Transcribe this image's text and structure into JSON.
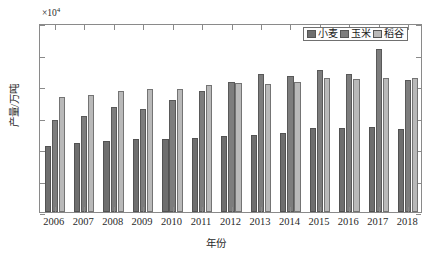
{
  "chart_data": {
    "type": "bar",
    "title": "",
    "subtitle": "",
    "xlabel": "年份",
    "ylabel": "产量/万吨",
    "y_exponent_text": "×10",
    "y_exponent_power": "4",
    "y_multiplier": 10000,
    "ylim": [
      0,
      30000
    ],
    "ytick_labels": [
      "0",
      "0.5",
      "1",
      "1.5",
      "2",
      "2.5",
      "3"
    ],
    "ytick_values": [
      0,
      5000,
      10000,
      15000,
      20000,
      25000,
      30000
    ],
    "grid": false,
    "legend_position": "top-right",
    "categories": [
      "2006",
      "2007",
      "2008",
      "2009",
      "2010",
      "2011",
      "2012",
      "2013",
      "2014",
      "2015",
      "2016",
      "2017",
      "2018"
    ],
    "series": [
      {
        "name": "小麦",
        "color": "#6e6e6e",
        "values": [
          10447,
          10930,
          11246,
          11512,
          11518,
          11740,
          12058,
          12193,
          12621,
          13264,
          13319,
          13424,
          13143
        ]
      },
      {
        "name": "玉米",
        "color": "#7d7d7d",
        "values": [
          14548,
          15230,
          16591,
          16397,
          17725,
          19278,
          20561,
          21849,
          21565,
          22463,
          21955,
          25907,
          21000
        ]
      },
      {
        "name": "稻谷",
        "color": "#b9b9b9",
        "values": [
          18257,
          18603,
          19190,
          19510,
          19576,
          20100,
          20424,
          20361,
          20651,
          21214,
          21109,
          21268,
          21213
        ]
      }
    ]
  },
  "legend": {
    "items": [
      {
        "label": "小麦",
        "color": "#6e6e6e"
      },
      {
        "label": "玉米",
        "color": "#7d7d7d"
      },
      {
        "label": "稻谷",
        "color": "#b9b9b9"
      }
    ]
  },
  "axes": {
    "x_title": "年份",
    "y_title": "产量/万吨",
    "exponent_prefix": "×10",
    "exponent_sup": "4"
  }
}
